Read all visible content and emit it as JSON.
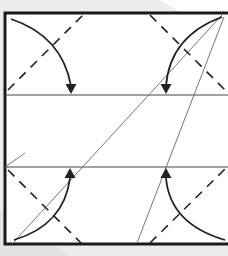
{
  "diagram": {
    "title": "Origami folding step: fold four corners to crease lines",
    "colors": {
      "background": "#ffffff",
      "shadow": "#e6e6e6",
      "border": "#1a1a1a",
      "crease": "#444444",
      "dashed": "#222222",
      "arrow": "#222222"
    },
    "paper": {
      "x": 5,
      "y": 13,
      "width": 226,
      "height": 231
    },
    "horizontal_creases": [
      95,
      167
    ],
    "valley_folds": [
      {
        "name": "top-left",
        "x1": 8,
        "y1": 90,
        "x2": 85,
        "y2": 13
      },
      {
        "name": "top-right",
        "x1": 150,
        "y1": 15,
        "x2": 228,
        "y2": 93
      },
      {
        "name": "bottom-left",
        "x1": 8,
        "y1": 170,
        "x2": 83,
        "y2": 245
      },
      {
        "name": "bottom-right",
        "x1": 150,
        "y1": 243,
        "x2": 228,
        "y2": 166
      }
    ],
    "arrows": [
      {
        "name": "top-left",
        "path": "M11,19 Q62,36 71,86",
        "head": {
          "x": 71,
          "y": 94,
          "dir": "down"
        }
      },
      {
        "name": "top-right",
        "path": "M222,17 Q170,36 166,86",
        "head": {
          "x": 166,
          "y": 94,
          "dir": "down"
        }
      },
      {
        "name": "bottom-left",
        "path": "M14,240 Q64,225 70,178",
        "head": {
          "x": 70,
          "y": 168,
          "dir": "up"
        }
      },
      {
        "name": "bottom-right",
        "path": "M225,240 Q170,224 166,178",
        "head": {
          "x": 166,
          "y": 168,
          "dir": "up"
        }
      }
    ],
    "thin_lines": [
      {
        "name": "diagonal-long",
        "x1": 222,
        "y1": 15,
        "x2": 12,
        "y2": 244
      },
      {
        "name": "diagonal-steep",
        "x1": 224,
        "y1": 17,
        "x2": 137,
        "y2": 243
      },
      {
        "name": "left-stub",
        "x1": 5,
        "y1": 167,
        "x2": 25,
        "y2": 153
      }
    ]
  }
}
